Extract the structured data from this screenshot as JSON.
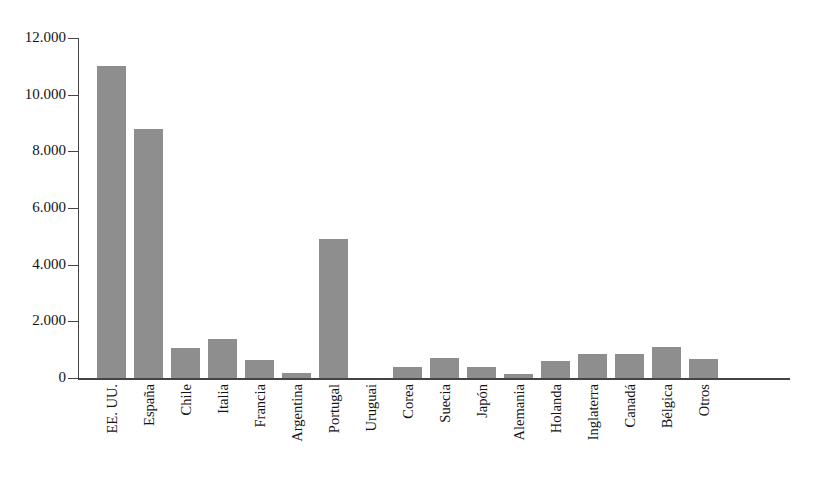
{
  "chart_data": {
    "type": "bar",
    "title": "",
    "xlabel": "",
    "ylabel": "",
    "ylim": [
      0,
      12000
    ],
    "grid": false,
    "legend": null,
    "y_ticks": [
      0,
      2000,
      4000,
      6000,
      8000,
      10000,
      12000
    ],
    "y_tick_labels": [
      "0",
      "2.000",
      "4.000",
      "6.000",
      "8.000",
      "10.000",
      "12.000"
    ],
    "bar_color": "#8e8e8e",
    "axis_color": "#444444",
    "categories": [
      "EE. UU.",
      "España",
      "Chile",
      "Italia",
      "Francia",
      "Argentina",
      "Portugal",
      "Uruguai",
      "Corea",
      "Suecia",
      "Japón",
      "Alemania",
      "Holanda",
      "Inglaterra",
      "Canadá",
      "Bélgica",
      "Otros"
    ],
    "values": [
      11000,
      8780,
      1060,
      1380,
      650,
      190,
      4900,
      0,
      380,
      720,
      400,
      140,
      590,
      830,
      860,
      1080,
      680
    ]
  },
  "title_remnant": ""
}
